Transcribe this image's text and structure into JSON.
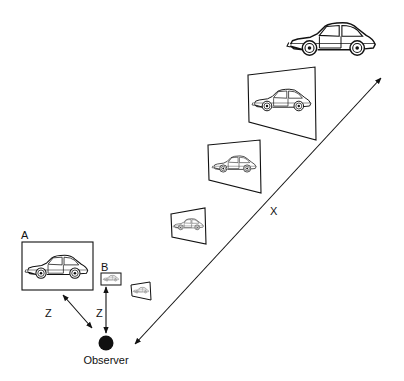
{
  "labels": {
    "a": "A",
    "b": "B",
    "z_diag": "Z",
    "z_vert": "Z",
    "x": "X",
    "observer": "Observer"
  },
  "colors": {
    "ink": "#111111",
    "background": "#ffffff"
  },
  "elements": {
    "car_icon": "sports-car-outline",
    "observer_icon": "filled-circle",
    "frames": [
      {
        "name": "frame-A",
        "kind": "rect"
      },
      {
        "name": "frame-B",
        "kind": "rect"
      },
      {
        "name": "frame-perspective-1",
        "kind": "quad"
      },
      {
        "name": "frame-perspective-2",
        "kind": "quad"
      },
      {
        "name": "frame-perspective-3",
        "kind": "quad"
      },
      {
        "name": "frame-perspective-4",
        "kind": "quad"
      }
    ]
  }
}
